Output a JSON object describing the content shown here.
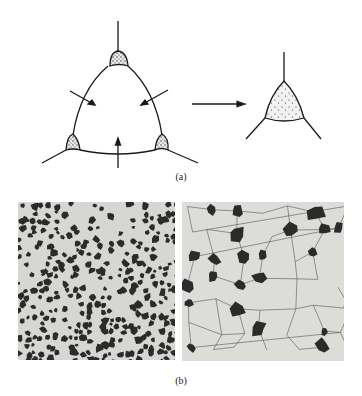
{
  "figure": {
    "panel_a": {
      "label": "(a)",
      "description": "Grain with three second-phase nuclei at triple junctions; arrows indicate boundary migration; grain shrinks to a single second-phase particle at a triple point",
      "colors": {
        "line": "#1a1a1a",
        "nucleus_fill": "#cfcfcf"
      }
    },
    "panel_b": {
      "label": "(b)",
      "micrographs": [
        {
          "name": "fine-microstructure",
          "description": "Fine dispersed dark phase in light matrix"
        },
        {
          "name": "coarse-microstructure",
          "description": "Coarse equiaxed light grains with dark phase at grain corners"
        }
      ],
      "colors": {
        "matrix": "#d9d9d6",
        "dark_phase": "#2b2b2b",
        "boundary": "#555555"
      }
    }
  }
}
